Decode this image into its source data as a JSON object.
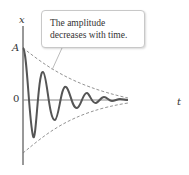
{
  "figure": {
    "callout_text_line1": "The amplitude",
    "callout_text_line2": "decreases with time.",
    "axis_label_y": "x",
    "axis_label_x": "t",
    "amplitude_label": "A",
    "zero_label": "0",
    "colors": {
      "curve": "#555555",
      "axis": "#333333",
      "envelope": "#777777",
      "callout_border": "#c8c8c8"
    }
  }
}
